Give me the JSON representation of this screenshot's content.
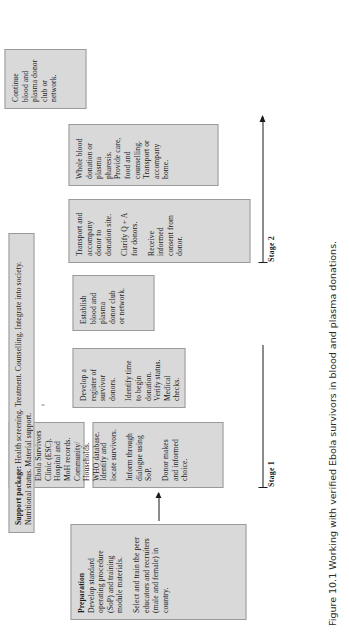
{
  "figure": {
    "caption": "Figure 10.1 Working with verified Ebola survivors in blood and plasma donations.",
    "stages": [
      {
        "label": "Stage 1"
      },
      {
        "label": "Stage 2"
      }
    ],
    "preparation": {
      "title": "Preparation",
      "paragraph_1": "Develop standard operating procedure (SoP) and training module materials.",
      "paragraph_2": "Select and train the peer educators and recruiters (male and female) in country."
    },
    "support_package": {
      "label": "Support package:",
      "text": "Health screening. Treatment. Counselling. Integrate into society. Nutritional status. Material support."
    },
    "boxes": [
      {
        "name": "identify-locate",
        "lines": [
          "Identify and locate survivors.",
          "Inform through dialogue using SoP.",
          "Donor makes and informed choice."
        ]
      },
      {
        "name": "sources",
        "lines": [
          "Ebola Survivors Union (ESU). Ebola Survivors Clinic (ESC). Hospital and MoH records. Community/ Households. WHO database."
        ]
      },
      {
        "name": "register",
        "lines": [
          "Develop a register of survivor donors.",
          "Identify time to begin donation. Verify status. Medical checks."
        ]
      },
      {
        "name": "establish-club",
        "lines": [
          "Establish blood and plasma donor club or network."
        ]
      },
      {
        "name": "transport-consent",
        "lines": [
          "Transport and accompany donor to donation site.",
          "Clarify Q + A for donors.",
          "Receive informed consent from donor."
        ]
      },
      {
        "name": "donation",
        "lines": [
          "Whole blood donation or plasma pharesis. Provide care, food and counselling. Transport or accompany home."
        ]
      },
      {
        "name": "continue-club",
        "lines": [
          "Continue blood and plasma donor club or network."
        ]
      }
    ]
  }
}
